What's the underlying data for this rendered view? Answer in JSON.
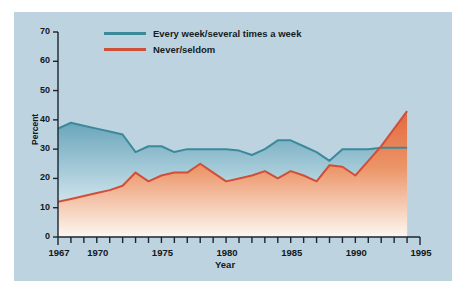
{
  "figure": {
    "background_color": "#bed3e0",
    "page_background": "#ffffff"
  },
  "axes": {
    "y_title": "Percent",
    "x_title": "Year",
    "y_ticks": [
      "0",
      "10",
      "20",
      "30",
      "40",
      "50",
      "60",
      "70"
    ],
    "x_ticks_labeled": [
      "1967",
      "1970",
      "1975",
      "1980",
      "1985",
      "1990",
      "1995"
    ]
  },
  "legend": {
    "items": [
      {
        "label": "Every week/several times a week",
        "color": "#3b8a9c"
      },
      {
        "label": "Never/seldom",
        "color": "#cf4f38"
      }
    ]
  },
  "chart_data": {
    "type": "line",
    "title": "",
    "subtitle": "",
    "xlabel": "Year",
    "ylabel": "Percent",
    "xlim": [
      1967,
      1995
    ],
    "ylim": [
      0,
      70
    ],
    "ytick_step": 10,
    "grid": false,
    "legend_position": "top-left",
    "x": [
      1967,
      1968,
      1969,
      1970,
      1971,
      1972,
      1973,
      1974,
      1975,
      1976,
      1977,
      1978,
      1979,
      1980,
      1981,
      1982,
      1983,
      1984,
      1985,
      1986,
      1987,
      1988,
      1989,
      1990,
      1991,
      1992,
      1993,
      1994
    ],
    "series": [
      {
        "name": "Every week/several times a week",
        "color": "#3b8a9c",
        "fill_top": "#5e9fb4",
        "fill_bottom": "#f3f7f8",
        "values": [
          37,
          39,
          38,
          37,
          36,
          35,
          29,
          31,
          31,
          29,
          30,
          30,
          30,
          30,
          29.5,
          28,
          30,
          33,
          33,
          31,
          29,
          26,
          30,
          30,
          30,
          30.5,
          30.5,
          30.5
        ]
      },
      {
        "name": "Never/seldom",
        "color": "#cf4f38",
        "fill_top": "#e06a43",
        "fill_bottom": "#fdf4ec",
        "values": [
          12,
          13,
          14,
          15,
          16,
          17.5,
          22,
          19,
          21,
          22,
          22,
          25,
          22,
          19,
          20,
          21,
          22.5,
          20,
          22.5,
          21,
          19,
          24.5,
          24,
          21,
          26,
          31,
          37,
          43
        ]
      }
    ],
    "annotations": [
      "Red series crosses above blue series near 1992",
      "Yearly tick marks on x-axis from 1967 to 1995"
    ]
  }
}
